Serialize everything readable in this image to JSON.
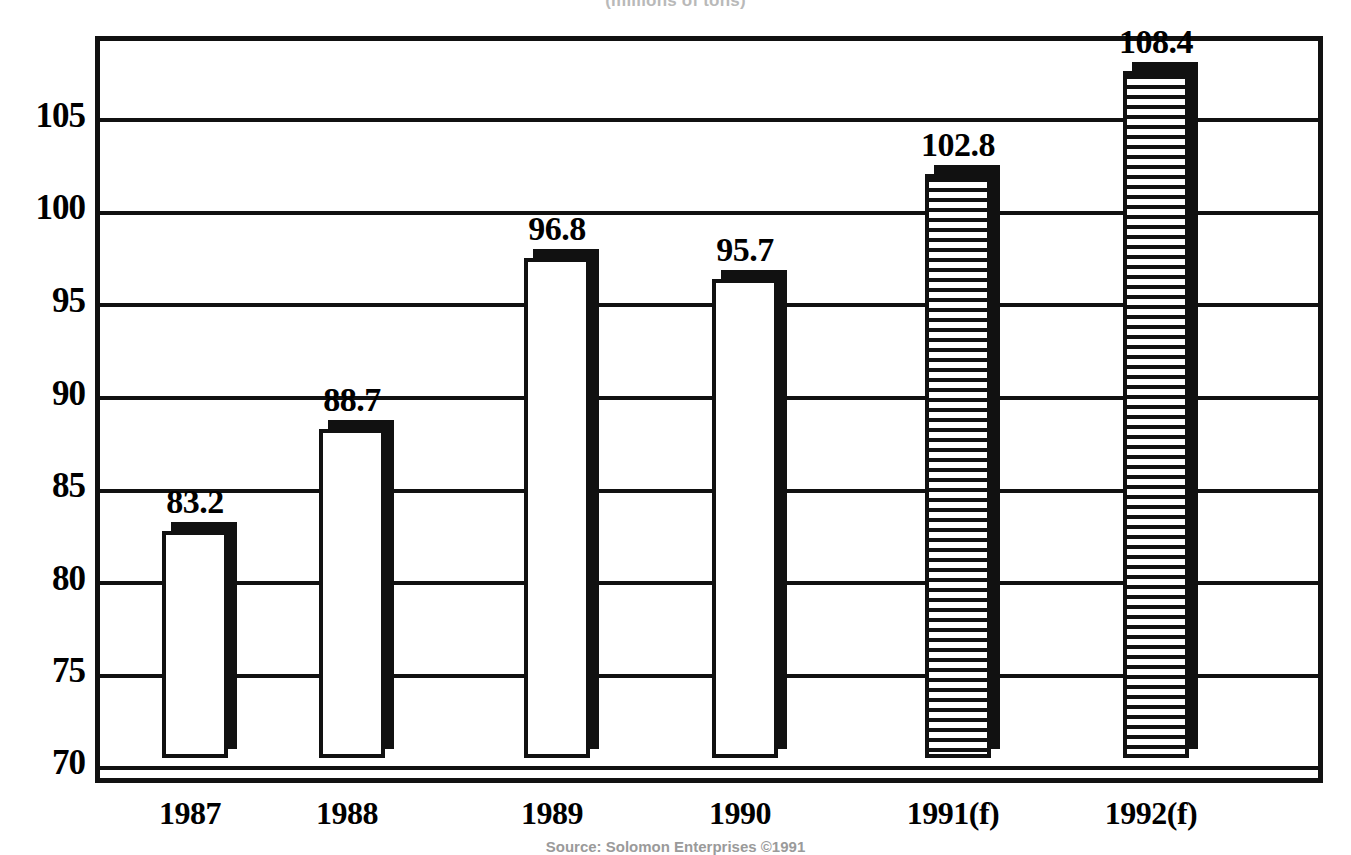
{
  "subtitle": "(millions of tons)",
  "source_note": "Source: Solomon Enterprises ©1991",
  "chart_data": {
    "type": "bar",
    "title": "",
    "subtitle": "(millions of tons)",
    "xlabel": "",
    "ylabel": "",
    "categories": [
      "1987",
      "1988",
      "1989",
      "1990",
      "1991(f)",
      "1992(f)"
    ],
    "values": [
      83.2,
      88.7,
      96.8,
      95.7,
      102.8,
      108.4
    ],
    "value_labels": [
      "83.2",
      "88.7",
      "96.8",
      "95.7",
      "102.8",
      "108.4"
    ],
    "series": [
      {
        "name": "Volume",
        "values": [
          83.2,
          88.7,
          96.8,
          95.7,
          102.8,
          108.4
        ],
        "styles": [
          "solid",
          "solid",
          "solid",
          "solid",
          "hatched",
          "hatched"
        ]
      }
    ],
    "ylim": [
      69.0,
      108.8
    ],
    "yticks": [
      70,
      75,
      80,
      85,
      90,
      95,
      100,
      105
    ],
    "ytick_labels": [
      "70",
      "75",
      "80",
      "85",
      "90",
      "95",
      "100",
      "105"
    ],
    "grid": true,
    "grid_axis": "y",
    "legend": "none",
    "bar_fill_colors": [
      "#ffffff",
      "#ffffff",
      "#ffffff",
      "#ffffff",
      "#ffffff",
      "#ffffff"
    ],
    "bar_edge_color": "#111111",
    "shadow_color": "#111111",
    "background_color": "#ffffff"
  },
  "yaxis": {
    "ticks": [
      {
        "label": "105",
        "top": 98
      },
      {
        "label": "100",
        "top": 190
      },
      {
        "label": "95",
        "top": 283
      },
      {
        "label": "90",
        "top": 376
      },
      {
        "label": "85",
        "top": 468
      },
      {
        "label": "80",
        "top": 561
      },
      {
        "label": "75",
        "top": 653
      },
      {
        "label": "70",
        "top": 745
      }
    ]
  },
  "gridlines": [
    {
      "top": 115
    },
    {
      "top": 208
    },
    {
      "top": 300
    },
    {
      "top": 393
    },
    {
      "top": 486
    },
    {
      "top": 578
    },
    {
      "top": 671
    },
    {
      "top": 763
    }
  ],
  "bars": [
    {
      "label": "1987",
      "value_label": "83.2",
      "left": 157,
      "width": 66,
      "top": 536,
      "style": "solid",
      "label_center": 190
    },
    {
      "label": "1988",
      "value_label": "88.7",
      "left": 314,
      "width": 66,
      "top": 434,
      "style": "solid",
      "label_center": 347
    },
    {
      "label": "1989",
      "value_label": "96.8",
      "left": 519,
      "width": 66,
      "top": 263,
      "style": "solid",
      "label_center": 552
    },
    {
      "label": "1990",
      "value_label": "95.7",
      "left": 707,
      "width": 66,
      "top": 284,
      "style": "solid",
      "label_center": 740
    },
    {
      "label": "1991(f)",
      "value_label": "102.8",
      "left": 920,
      "width": 66,
      "top": 179,
      "style": "hatched",
      "label_center": 953
    },
    {
      "label": "1992(f)",
      "value_label": "108.4",
      "left": 1118,
      "width": 66,
      "top": 76,
      "style": "hatched",
      "label_center": 1151
    }
  ]
}
